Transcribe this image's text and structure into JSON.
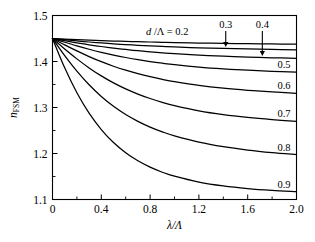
{
  "figure": {
    "name": "effective-index-plot",
    "background_color": "#ffffff",
    "line_color": "#000000"
  },
  "chart_data": {
    "type": "line",
    "title": "",
    "xlabel": "λ/Λ",
    "ylabel": "n_FSM",
    "ylabel_main": "n",
    "ylabel_sub": "FSM",
    "xlim": [
      0,
      2.0
    ],
    "ylim": [
      1.1,
      1.5
    ],
    "grid": false,
    "legend_position": "inline-right",
    "xticks": [
      0,
      0.4,
      0.8,
      1.2,
      1.6,
      2.0
    ],
    "xticklabels": [
      "0",
      "0.4",
      "0.8",
      "1.2",
      "1.6",
      "2.0"
    ],
    "xminorticks": [
      0.2,
      0.6,
      1.0,
      1.4,
      1.8
    ],
    "yticks": [
      1.1,
      1.2,
      1.3,
      1.4,
      1.5
    ],
    "yticklabels": [
      "1.1",
      "1.2",
      "1.3",
      "1.4",
      "1.5"
    ],
    "yminorticks": [
      1.15,
      1.25,
      1.35,
      1.45
    ],
    "series_parameter_label": "d /Λ",
    "annotation": "d /Λ = 0.2",
    "annotation_parts": {
      "symbol": "d",
      "rest": " /Λ = 0.2"
    },
    "start_point": [
      0,
      1.45
    ],
    "series": [
      {
        "name": "0.2",
        "label": "0.2",
        "label_kind": "annotation-top",
        "x": [
          0,
          0.1,
          0.2,
          0.3,
          0.4,
          0.5,
          0.6,
          0.7,
          0.8,
          0.9,
          1.0,
          1.2,
          1.4,
          1.6,
          1.8,
          2.0
        ],
        "values": [
          1.45,
          1.4487,
          1.4475,
          1.4464,
          1.4454,
          1.4445,
          1.4437,
          1.443,
          1.4424,
          1.4418,
          1.4412,
          1.4402,
          1.4394,
          1.4387,
          1.4381,
          1.4376
        ]
      },
      {
        "name": "0.3",
        "label": "0.3",
        "label_kind": "arrow-top",
        "x": [
          0,
          0.1,
          0.2,
          0.3,
          0.4,
          0.5,
          0.6,
          0.7,
          0.8,
          0.9,
          1.0,
          1.2,
          1.4,
          1.6,
          1.8,
          2.0
        ],
        "values": [
          1.45,
          1.4473,
          1.4447,
          1.4424,
          1.4403,
          1.4384,
          1.4367,
          1.4352,
          1.4339,
          1.4327,
          1.4316,
          1.4298,
          1.4284,
          1.4272,
          1.4263,
          1.4255
        ]
      },
      {
        "name": "0.4",
        "label": "0.4",
        "label_kind": "arrow-top",
        "x": [
          0,
          0.1,
          0.2,
          0.3,
          0.4,
          0.5,
          0.6,
          0.7,
          0.8,
          0.9,
          1.0,
          1.2,
          1.4,
          1.6,
          1.8,
          2.0
        ],
        "values": [
          1.45,
          1.4452,
          1.4406,
          1.4364,
          1.4326,
          1.4292,
          1.4261,
          1.4234,
          1.421,
          1.4189,
          1.417,
          1.4139,
          1.4115,
          1.4096,
          1.4081,
          1.4069
        ]
      },
      {
        "name": "0.5",
        "label": "0.5",
        "label_kind": "right-inline",
        "x": [
          0,
          0.1,
          0.2,
          0.3,
          0.4,
          0.5,
          0.6,
          0.7,
          0.8,
          0.9,
          1.0,
          1.2,
          1.4,
          1.6,
          1.8,
          2.0
        ],
        "values": [
          1.45,
          1.4418,
          1.4339,
          1.4266,
          1.4199,
          1.414,
          1.4087,
          1.404,
          1.3999,
          1.3963,
          1.3931,
          1.3879,
          1.384,
          1.381,
          1.3786,
          1.3767
        ]
      },
      {
        "name": "0.6",
        "label": "0.6",
        "label_kind": "right-inline",
        "x": [
          0,
          0.1,
          0.2,
          0.3,
          0.4,
          0.5,
          0.6,
          0.7,
          0.8,
          0.9,
          1.0,
          1.2,
          1.4,
          1.6,
          1.8,
          2.0
        ],
        "values": [
          1.45,
          1.4362,
          1.423,
          1.4107,
          1.3996,
          1.3897,
          1.3811,
          1.3735,
          1.3669,
          1.3612,
          1.3562,
          1.3481,
          1.342,
          1.3374,
          1.3338,
          1.3309
        ]
      },
      {
        "name": "0.7",
        "label": "0.7",
        "label_kind": "right-inline",
        "x": [
          0,
          0.1,
          0.2,
          0.3,
          0.4,
          0.5,
          0.6,
          0.7,
          0.8,
          0.9,
          1.0,
          1.2,
          1.4,
          1.6,
          1.8,
          2.0
        ],
        "values": [
          1.45,
          1.4272,
          1.4057,
          1.3861,
          1.3687,
          1.3535,
          1.3404,
          1.3291,
          1.3195,
          1.3112,
          1.3042,
          1.2929,
          1.2846,
          1.2784,
          1.2736,
          1.2698
        ]
      },
      {
        "name": "0.8",
        "label": "0.8",
        "label_kind": "right-inline",
        "x": [
          0,
          0.1,
          0.2,
          0.3,
          0.4,
          0.5,
          0.6,
          0.7,
          0.8,
          0.9,
          1.0,
          1.2,
          1.4,
          1.6,
          1.8,
          2.0
        ],
        "values": [
          1.45,
          1.4129,
          1.3791,
          1.3494,
          1.324,
          1.3026,
          1.2847,
          1.2698,
          1.2574,
          1.247,
          1.2383,
          1.2247,
          1.2148,
          1.2075,
          1.2019,
          1.1975
        ]
      },
      {
        "name": "0.9",
        "label": "0.9",
        "label_kind": "right-inline",
        "x": [
          0,
          0.1,
          0.2,
          0.3,
          0.4,
          0.5,
          0.6,
          0.7,
          0.8,
          0.9,
          1.0,
          1.2,
          1.4,
          1.6,
          1.8,
          2.0
        ],
        "values": [
          1.45,
          1.3863,
          1.3321,
          1.2877,
          1.2521,
          1.2239,
          1.2016,
          1.1841,
          1.1703,
          1.1593,
          1.1506,
          1.1379,
          1.1295,
          1.1238,
          1.1198,
          1.1169
        ]
      }
    ],
    "arrow_annotations": [
      {
        "label": "0.3",
        "x_data": 1.42,
        "points_to_series": "0.3"
      },
      {
        "label": "0.4",
        "x_data": 1.72,
        "points_to_series": "0.4"
      }
    ]
  }
}
